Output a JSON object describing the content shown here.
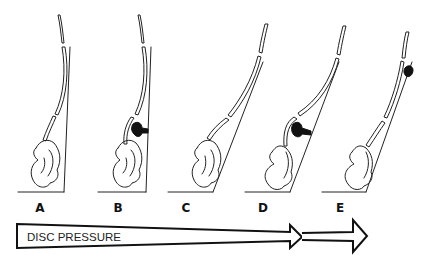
{
  "figure": {
    "panels": [
      {
        "label": "A",
        "description": "upright spine, no disc bulge"
      },
      {
        "label": "B",
        "description": "upright spine with lumbar disc protrusion"
      },
      {
        "label": "C",
        "description": "forward-leaning spine, no disc bulge"
      },
      {
        "label": "D",
        "description": "forward-leaning spine with lumbar disc protrusion"
      },
      {
        "label": "E",
        "description": "forward-leaning spine with cervical disc bulge"
      }
    ],
    "arrow": {
      "label": "DISC PRESSURE",
      "direction": "increasing left to right"
    }
  }
}
